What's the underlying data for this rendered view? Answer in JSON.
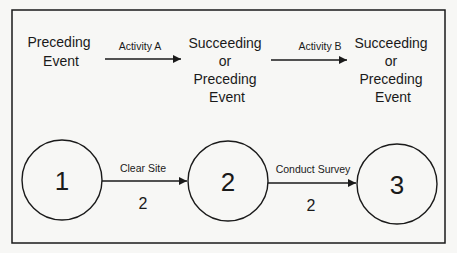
{
  "diagram": {
    "type": "activity-on-arrow network",
    "legend_row": {
      "events": [
        {
          "lines": [
            "Preceding",
            "Event"
          ]
        },
        {
          "lines": [
            "Succeeding",
            "or",
            "Preceding",
            "Event"
          ]
        },
        {
          "lines": [
            "Succeeding",
            "or",
            "Preceding",
            "Event"
          ]
        }
      ],
      "activities": [
        {
          "label": "Activity A"
        },
        {
          "label": "Activity B"
        }
      ]
    },
    "example_row": {
      "nodes": [
        {
          "id": "1",
          "label": "1"
        },
        {
          "id": "2",
          "label": "2"
        },
        {
          "id": "3",
          "label": "3"
        }
      ],
      "activities": [
        {
          "from": "1",
          "to": "2",
          "label": "Clear Site",
          "duration": "2"
        },
        {
          "from": "2",
          "to": "3",
          "label": "Conduct Survey",
          "duration": "2"
        }
      ]
    },
    "colors": {
      "stroke": "#1a1a1a",
      "background": "#f7f7f5"
    }
  }
}
